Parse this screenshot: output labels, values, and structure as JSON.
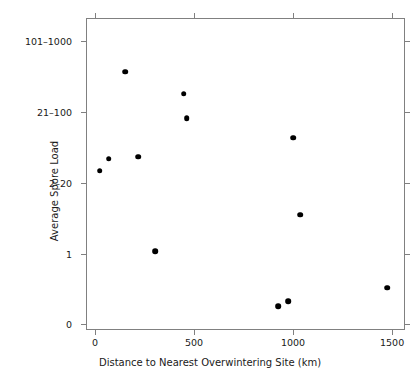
{
  "chart_data": {
    "type": "scatter",
    "title": "",
    "xlabel": "Distance to Nearest Overwintering Site (km)",
    "ylabel": "Average Spore Load",
    "xlim": [
      -45,
      1565
    ],
    "xticks": [
      0,
      500,
      1000,
      1500
    ],
    "xticklabels": [
      "0",
      "500",
      "1000",
      "1500"
    ],
    "yticklabels": [
      "101–1000",
      "21–100",
      "2–20",
      "1",
      "0"
    ],
    "ytick_values": [
      4,
      3,
      2,
      1,
      0
    ],
    "ylim": [
      -0.08,
      4.33
    ],
    "grid": false,
    "legend": null,
    "marker": "filled-circle",
    "marker_color": "#000000",
    "points": [
      {
        "x": 25,
        "y": 2.17,
        "label": "point-1"
      },
      {
        "x": 70,
        "y": 2.34,
        "label": "point-2"
      },
      {
        "x": 152,
        "y": 3.57,
        "label": "point-3"
      },
      {
        "x": 217,
        "y": 2.37,
        "label": "point-4"
      },
      {
        "x": 303,
        "y": 1.03,
        "label": "point-5"
      },
      {
        "x": 449,
        "y": 3.26,
        "label": "point-6"
      },
      {
        "x": 464,
        "y": 2.91,
        "label": "point-7"
      },
      {
        "x": 1000,
        "y": 2.64,
        "label": "point-8"
      },
      {
        "x": 1035,
        "y": 1.55,
        "label": "point-9"
      },
      {
        "x": 924,
        "y": 0.26,
        "label": "point-10"
      },
      {
        "x": 975,
        "y": 0.33,
        "label": "point-11"
      },
      {
        "x": 1475,
        "y": 0.52,
        "label": "point-12"
      }
    ]
  },
  "figure": {
    "axis_color": "#808080",
    "text_color": "#1a1a1a",
    "background": "#ffffff"
  }
}
